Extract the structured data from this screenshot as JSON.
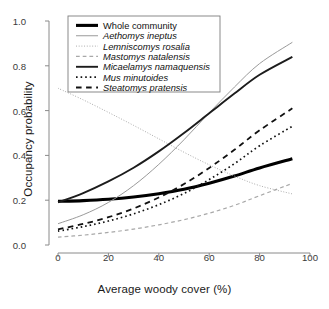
{
  "chart_data": {
    "type": "line",
    "title": "",
    "xlabel": "Average woody cover (%)",
    "ylabel": "Occupancy probability",
    "xlim": [
      0,
      100
    ],
    "ylim": [
      0,
      1
    ],
    "xticks": [
      "0",
      "20",
      "40",
      "60",
      "80",
      "100"
    ],
    "xtick_values": [
      0,
      20,
      40,
      60,
      80,
      100
    ],
    "yticks": [
      "0.0",
      "0.2",
      "0.4",
      "0.6",
      "0.8",
      "1.0"
    ],
    "ytick_values": [
      0.0,
      0.2,
      0.4,
      0.6,
      0.8,
      1.0
    ],
    "grid": false,
    "legend_position": "top-left",
    "x": [
      0,
      10,
      20,
      30,
      40,
      50,
      60,
      70,
      80,
      93
    ],
    "series": [
      {
        "name": "Whole community",
        "style": "solid",
        "width": 3.1,
        "color": "#000000",
        "italic": false,
        "values": [
          0.195,
          0.198,
          0.204,
          0.214,
          0.229,
          0.249,
          0.276,
          0.308,
          0.344,
          0.385
        ]
      },
      {
        "name": "Aethomys ineptus",
        "style": "solid",
        "width": 1.0,
        "color": "#9a9a9a",
        "italic": true,
        "values": [
          0.095,
          0.135,
          0.19,
          0.265,
          0.36,
          0.47,
          0.59,
          0.705,
          0.81,
          0.905
        ]
      },
      {
        "name": "Lemniscomys rosalia",
        "style": "dotted",
        "width": 1.0,
        "color": "#a8a8a8",
        "italic": true,
        "values": [
          0.7,
          0.648,
          0.592,
          0.534,
          0.474,
          0.414,
          0.358,
          0.308,
          0.265,
          0.228
        ]
      },
      {
        "name": "Mastomys natalensis",
        "style": "dashed",
        "width": 1.2,
        "color": "#a8a8a8",
        "italic": true,
        "values": [
          0.035,
          0.044,
          0.056,
          0.071,
          0.09,
          0.113,
          0.142,
          0.177,
          0.22,
          0.275
        ]
      },
      {
        "name": "Micaelamys namaquensis",
        "style": "solid",
        "width": 1.9,
        "color": "#1c1c1c",
        "italic": true,
        "values": [
          0.19,
          0.232,
          0.284,
          0.345,
          0.418,
          0.5,
          0.588,
          0.676,
          0.76,
          0.84
        ]
      },
      {
        "name": "Mus minutoides",
        "style": "dotted",
        "width": 1.7,
        "color": "#111111",
        "italic": true,
        "values": [
          0.062,
          0.082,
          0.107,
          0.139,
          0.18,
          0.23,
          0.292,
          0.363,
          0.443,
          0.53
        ]
      },
      {
        "name": "Steatomys pratensis",
        "style": "dashed",
        "width": 1.8,
        "color": "#111111",
        "italic": true,
        "values": [
          0.07,
          0.094,
          0.124,
          0.163,
          0.212,
          0.272,
          0.344,
          0.425,
          0.512,
          0.61
        ]
      }
    ]
  },
  "legend": {
    "items": [
      {
        "label": "Whole community"
      },
      {
        "label": "Aethomys ineptus"
      },
      {
        "label": "Lemniscomys rosalia"
      },
      {
        "label": "Mastomys natalensis"
      },
      {
        "label": "Micaelamys namaquensis"
      },
      {
        "label": "Mus minutoides"
      },
      {
        "label": "Steatomys pratensis"
      }
    ]
  },
  "axes": {
    "x_title": "Average woody cover (%)",
    "y_title": "Occupancy probability"
  }
}
